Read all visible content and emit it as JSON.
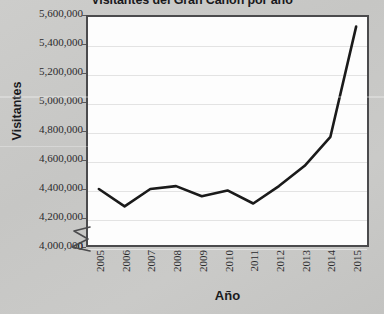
{
  "chart_data": {
    "type": "line",
    "title": "Visitantes del Gran Cañón por año",
    "xlabel": "Año",
    "ylabel": "Visitantes",
    "categories": [
      "2005",
      "2006",
      "2007",
      "2008",
      "2009",
      "2010",
      "2011",
      "2012",
      "2013",
      "2014",
      "2015"
    ],
    "values": [
      4400000,
      4280000,
      4400000,
      4420000,
      4350000,
      4390000,
      4300000,
      4420000,
      4560000,
      4760000,
      5520000
    ],
    "series": [
      {
        "name": "Visitantes",
        "values": [
          4400000,
          4280000,
          4400000,
          4420000,
          4350000,
          4390000,
          4300000,
          4420000,
          4560000,
          4760000,
          5520000
        ]
      }
    ],
    "ylim": [
      4000000,
      5600000
    ],
    "y_tick_labels": [
      "5,600,000",
      "5,400,000",
      "5,200,000",
      "5,000,000",
      "4,800,000",
      "4,600,000",
      "4,400,000",
      "4,200,000",
      "4,000,000"
    ],
    "y_tick_values": [
      5600000,
      5400000,
      5200000,
      5000000,
      4800000,
      4600000,
      4400000,
      4200000,
      4000000
    ],
    "y_origin_label": "0",
    "axis_break": true,
    "grid": true,
    "legend": "none",
    "line_color": "#1a1a1a",
    "plot_background": "#fdfdfd",
    "page_background": "#c8c8c6"
  }
}
